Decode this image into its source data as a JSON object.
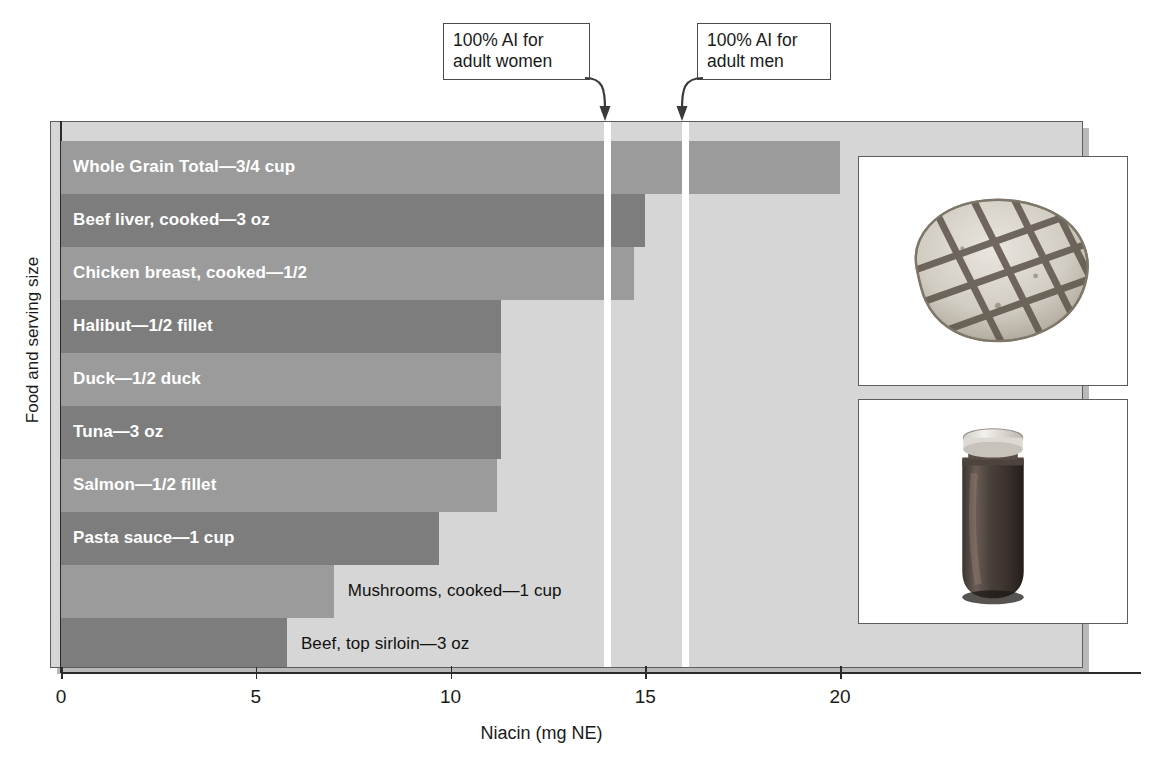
{
  "chart_data": {
    "type": "bar",
    "orientation": "horizontal",
    "title": "",
    "xlabel": "Niacin (mg NE)",
    "ylabel": "Food and serving size",
    "xlim": [
      0,
      26.4
    ],
    "xticks": [
      0,
      5,
      10,
      15,
      20
    ],
    "xtick_labels": [
      "0",
      "5",
      "10",
      "15",
      "20"
    ],
    "grid": false,
    "legend": null,
    "categories": [
      "Whole Grain Total—3/4 cup",
      "Beef liver, cooked—3 oz",
      "Chicken breast, cooked—1/2",
      "Halibut—1/2 fillet",
      "Duck—1/2 duck",
      "Tuna—3 oz",
      "Salmon—1/2 fillet",
      "Pasta sauce—1 cup",
      "Mushrooms, cooked—1 cup",
      "Beef, top sirloin—3 oz"
    ],
    "values": [
      20.0,
      15.0,
      14.7,
      11.3,
      11.3,
      11.3,
      11.2,
      9.7,
      7.0,
      5.8
    ],
    "bar_colors": [
      "#9b9b9b",
      "#7d7d7d",
      "#9b9b9b",
      "#7d7d7d",
      "#9b9b9b",
      "#7d7d7d",
      "#9b9b9b",
      "#7d7d7d",
      "#9b9b9b",
      "#7d7d7d"
    ],
    "label_placement": [
      "inside",
      "inside",
      "inside",
      "inside",
      "inside",
      "inside",
      "inside",
      "inside",
      "outside",
      "outside"
    ],
    "annotations": [
      {
        "name": "ai-women",
        "value": 14,
        "label": "100% AI for\nadult women",
        "line_color": "#ffffff"
      },
      {
        "name": "ai-men",
        "value": 16,
        "label": "100% AI for\nadult men",
        "line_color": "#ffffff"
      }
    ],
    "plot_background": "#d6d6d6"
  },
  "callouts": {
    "women": "100% AI for\nadult women",
    "men": "100% AI for\nadult men"
  },
  "axes": {
    "x_title": "Niacin (mg NE)",
    "y_title": "Food and serving size",
    "tick_labels": [
      "0",
      "5",
      "10",
      "15",
      "20"
    ]
  },
  "photos": [
    {
      "name": "grilled-chicken-breast",
      "caption": ""
    },
    {
      "name": "pasta-sauce-jar",
      "caption": ""
    }
  ]
}
